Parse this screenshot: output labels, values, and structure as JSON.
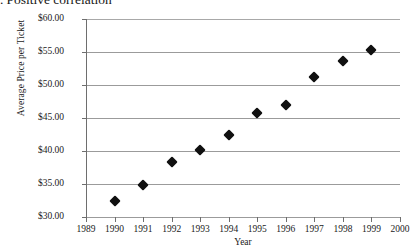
{
  "caption": {
    "marker": ".",
    "text": "Positive correlation"
  },
  "chart_data": {
    "type": "scatter",
    "xlabel": "Year",
    "ylabel": "Average Price per Ticket",
    "xlim": [
      1989,
      2000
    ],
    "ylim": [
      30,
      60
    ],
    "grid": true,
    "legend": false,
    "marker_style": "filled-diamond",
    "marker_color": "#101010",
    "x_ticks": [
      1989,
      1990,
      1991,
      1992,
      1993,
      1994,
      1995,
      1996,
      1997,
      1998,
      1999,
      2000
    ],
    "x_tick_labels": [
      "1989",
      "1990",
      "1991",
      "1992",
      "1993",
      "1994",
      "1995",
      "1996",
      "1997",
      "1998",
      "1999",
      "2000"
    ],
    "y_ticks": [
      30,
      35,
      40,
      45,
      50,
      55,
      60
    ],
    "y_tick_labels": [
      "$30.00",
      "$35.00",
      "$40.00",
      "$45.00",
      "$50.00",
      "$55.00",
      "$60.00"
    ],
    "x": [
      1990,
      1991,
      1992,
      1993,
      1994,
      1995,
      1996,
      1997,
      1998,
      1999
    ],
    "values": [
      32.5,
      34.9,
      38.4,
      40.1,
      42.5,
      45.7,
      46.9,
      51.2,
      53.7,
      55.3
    ],
    "points": [
      {
        "year": "1990",
        "price": "$32.50"
      },
      {
        "year": "1991",
        "price": "$34.90"
      },
      {
        "year": "1992",
        "price": "$38.40"
      },
      {
        "year": "1993",
        "price": "$40.10"
      },
      {
        "year": "1994",
        "price": "$42.50"
      },
      {
        "year": "1995",
        "price": "$45.70"
      },
      {
        "year": "1996",
        "price": "$46.90"
      },
      {
        "year": "1997",
        "price": "$51.20"
      },
      {
        "year": "1998",
        "price": "$53.70"
      },
      {
        "year": "1999",
        "price": "$55.30"
      }
    ]
  }
}
